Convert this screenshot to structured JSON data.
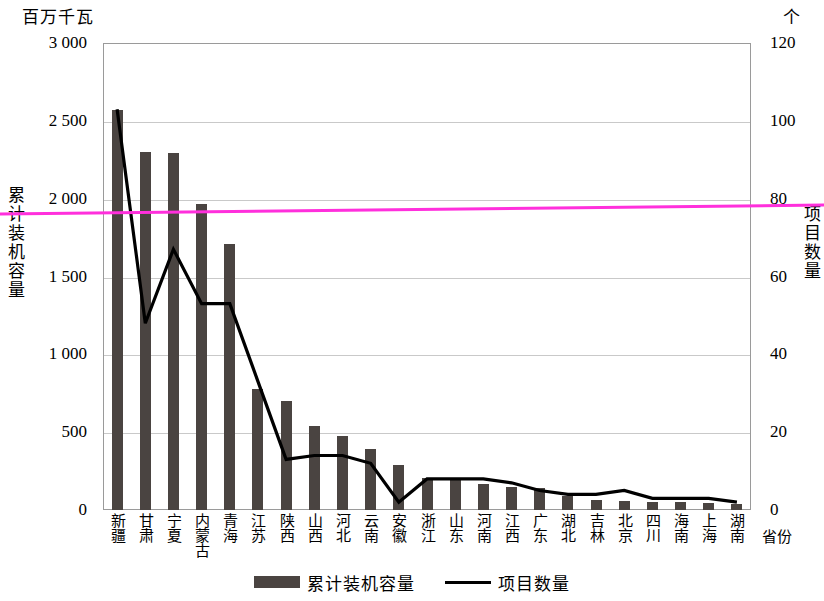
{
  "chart_data": {
    "type": "bar",
    "title": "",
    "xlabel": "省份",
    "ylabel": "累计装机容量",
    "y2label": "项目数量",
    "unit_left": "百万千瓦",
    "unit_right": "个",
    "ylim": [
      0,
      3000
    ],
    "y2lim": [
      0,
      120
    ],
    "yticks": [
      "0",
      "500",
      "1 000",
      "1 500",
      "2 000",
      "2 500",
      "3 000"
    ],
    "ytick_values": [
      0,
      500,
      1000,
      1500,
      2000,
      2500,
      3000
    ],
    "y2ticks": [
      "0",
      "20",
      "40",
      "60",
      "80",
      "100",
      "120"
    ],
    "y2tick_values": [
      0,
      20,
      40,
      60,
      80,
      100,
      120
    ],
    "grid": true,
    "legend_position": "bottom-center",
    "categories": [
      "新疆",
      "甘肃",
      "宁夏",
      "内蒙古",
      "青海",
      "江苏",
      "陕西",
      "山西",
      "河北",
      "云南",
      "安徽",
      "浙江",
      "山东",
      "河南",
      "江西",
      "广东",
      "湖北",
      "吉林",
      "北京",
      "四川",
      "海南",
      "上海",
      "湖南"
    ],
    "series": [
      {
        "name": "累计装机容量",
        "type": "bar",
        "axis": "left",
        "color": "#4a4441",
        "values": [
          2570,
          2300,
          2295,
          1965,
          1710,
          780,
          700,
          540,
          475,
          390,
          290,
          205,
          195,
          165,
          150,
          140,
          90,
          65,
          55,
          50,
          50,
          45,
          40
        ]
      },
      {
        "name": "项目数量",
        "type": "line",
        "axis": "right",
        "color": "#000000",
        "values": [
          103,
          48,
          67,
          53,
          53,
          33,
          13,
          14,
          14,
          12,
          2,
          8,
          8,
          8,
          7,
          5,
          4,
          4,
          5,
          3,
          3,
          3,
          2
        ]
      }
    ]
  },
  "legend": {
    "items": [
      {
        "label": "累计装机容量",
        "marker": "bar-swatch"
      },
      {
        "label": "项目数量",
        "marker": "line-swatch"
      }
    ]
  },
  "annotations": {
    "stray_rule_color": "#ff2fdc"
  }
}
